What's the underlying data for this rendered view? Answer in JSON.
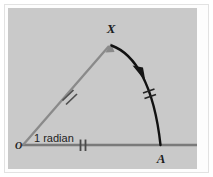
{
  "figure": {
    "background_color": "#c9c9c9",
    "frame_color": "#ffffff",
    "border_color": "#e2e2e2",
    "labels": {
      "origin": "O",
      "arc_endpoint_top": "X",
      "arc_endpoint_base": "A",
      "angle_annotation": "1 radian"
    },
    "colors": {
      "radius_line": "#7a7a7a",
      "arc_line": "#111111",
      "tick_mark": "#4a4a4a",
      "label_text": "#1d1d1d",
      "annotation_text": "#222222"
    },
    "geometry": {
      "origin_point": "(16, 137)",
      "apex_point_x": "(103, 36)",
      "base_point_a": "(153, 137)",
      "radius_length_px": "133",
      "angle_degrees": "57.3",
      "angle_radians": "1"
    },
    "marks": {
      "radius_ox_ticks": "2",
      "radius_oa_ticks": "2",
      "arc_ticks": "2",
      "arc_direction": "counterclockwise",
      "arrowheads": "2"
    }
  }
}
